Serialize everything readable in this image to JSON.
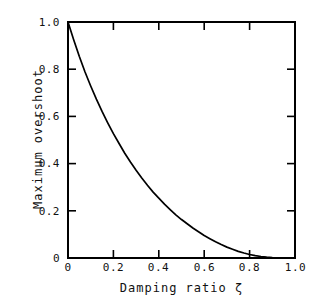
{
  "chart_data": {
    "type": "line",
    "title": "",
    "xlabel": "Damping ratio ζ",
    "ylabel": "Maximum overshoot",
    "xlim": [
      0,
      1.0
    ],
    "ylim": [
      0,
      1.0
    ],
    "grid": false,
    "legend": null,
    "x_ticks": [
      "0",
      "0.2",
      "0.4",
      "0.6",
      "0.8",
      "1.0"
    ],
    "x_tick_values": [
      0,
      0.2,
      0.4,
      0.6,
      0.8,
      1.0
    ],
    "y_ticks": [
      "0",
      "0.2",
      "0.4",
      "0.6",
      "0.8",
      "1.0"
    ],
    "y_tick_values": [
      0,
      0.2,
      0.4,
      0.6,
      0.8,
      1.0
    ],
    "series": [
      {
        "name": "Maximum overshoot",
        "color": "#000000",
        "x": [
          0.0,
          0.025,
          0.05,
          0.075,
          0.1,
          0.125,
          0.15,
          0.175,
          0.2,
          0.225,
          0.25,
          0.275,
          0.3,
          0.325,
          0.35,
          0.375,
          0.4,
          0.425,
          0.45,
          0.475,
          0.5,
          0.525,
          0.55,
          0.575,
          0.6,
          0.625,
          0.65,
          0.675,
          0.7,
          0.725,
          0.75,
          0.775,
          0.8,
          0.825,
          0.85,
          0.875,
          0.9,
          0.925,
          0.95,
          0.975,
          1.0
        ],
        "y": [
          1.0,
          0.925,
          0.854,
          0.788,
          0.729,
          0.673,
          0.621,
          0.573,
          0.527,
          0.485,
          0.444,
          0.407,
          0.372,
          0.339,
          0.308,
          0.279,
          0.254,
          0.228,
          0.205,
          0.183,
          0.163,
          0.145,
          0.127,
          0.111,
          0.095,
          0.082,
          0.069,
          0.057,
          0.046,
          0.037,
          0.028,
          0.021,
          0.015,
          0.01,
          0.0063,
          0.0034,
          0.0015,
          0.0004,
          4e-05,
          0.0,
          0.0
        ]
      }
    ]
  },
  "axis": {
    "x_label": "Damping ratio ζ",
    "y_label": "Maximum overshoot",
    "x_tick_labels": [
      "0",
      "0.2",
      "0.4",
      "0.6",
      "0.8",
      "1.0"
    ],
    "y_tick_labels": [
      "0",
      "0.2",
      "0.4",
      "0.6",
      "0.8",
      "1.0"
    ]
  },
  "colors": {
    "background": "#ffffff",
    "axis": "#000000",
    "curve": "#000000",
    "text": "#111111"
  }
}
